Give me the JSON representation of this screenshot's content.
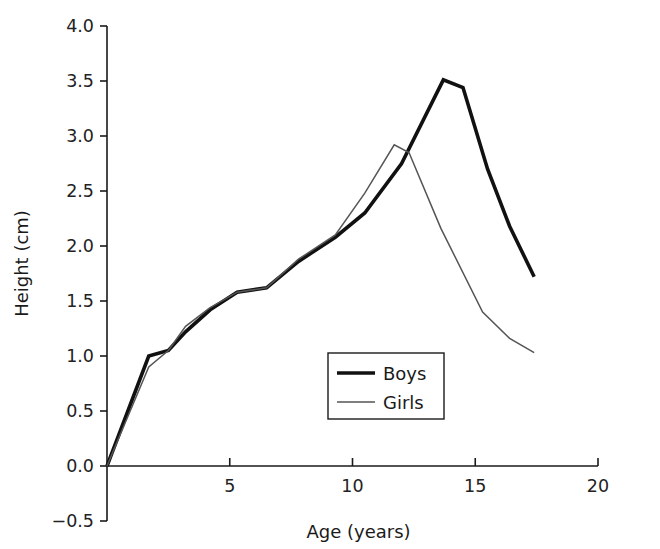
{
  "chart_data": {
    "type": "line",
    "title": "",
    "xlabel": "Age (years)",
    "ylabel": "Height (cm)",
    "xlim": [
      0,
      20
    ],
    "ylim": [
      -0.5,
      4.0
    ],
    "xticks": [
      0,
      5,
      10,
      15,
      20
    ],
    "xtick_labels": [
      "",
      "5",
      "10",
      "15",
      "20"
    ],
    "yticks": [
      -0.5,
      0.0,
      0.5,
      1.0,
      1.5,
      2.0,
      2.5,
      3.0,
      3.5,
      4.0
    ],
    "ytick_labels": [
      "−0.5",
      "0.0",
      "0.5",
      "1.0",
      "1.5",
      "2.0",
      "2.5",
      "3.0",
      "3.5",
      "4.0"
    ],
    "grid": false,
    "legend_position": "center",
    "series": [
      {
        "name": "Boys",
        "color": "#111111",
        "line_width": 3.6,
        "points": [
          [
            0.0,
            0.0
          ],
          [
            1.7,
            1.0
          ],
          [
            2.5,
            1.05
          ],
          [
            3.2,
            1.22
          ],
          [
            4.2,
            1.42
          ],
          [
            5.3,
            1.58
          ],
          [
            6.5,
            1.62
          ],
          [
            7.8,
            1.86
          ],
          [
            9.3,
            2.08
          ],
          [
            10.5,
            2.3
          ],
          [
            12.0,
            2.75
          ],
          [
            13.7,
            3.51
          ],
          [
            14.5,
            3.44
          ],
          [
            15.5,
            2.7
          ],
          [
            16.4,
            2.18
          ],
          [
            17.4,
            1.72
          ]
        ]
      },
      {
        "name": "Girls",
        "color": "#555555",
        "line_width": 1.5,
        "points": [
          [
            0.0,
            0.0
          ],
          [
            1.7,
            0.9
          ],
          [
            2.5,
            1.05
          ],
          [
            3.2,
            1.27
          ],
          [
            4.2,
            1.44
          ],
          [
            5.3,
            1.58
          ],
          [
            6.5,
            1.62
          ],
          [
            7.8,
            1.88
          ],
          [
            9.3,
            2.1
          ],
          [
            10.5,
            2.48
          ],
          [
            11.7,
            2.92
          ],
          [
            12.3,
            2.85
          ],
          [
            13.6,
            2.16
          ],
          [
            15.3,
            1.4
          ],
          [
            16.4,
            1.16
          ],
          [
            17.4,
            1.03
          ]
        ]
      }
    ],
    "legend_entries": [
      {
        "label": "Boys"
      },
      {
        "label": "Girls"
      }
    ]
  }
}
